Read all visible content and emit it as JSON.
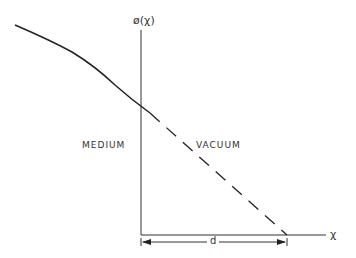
{
  "diagram": {
    "y_axis_label": "ø(χ)",
    "x_axis_label": "χ",
    "region_left_label": "MEDIUM",
    "region_right_label": "VACUUM",
    "distance_label": "d",
    "ink_color": "#222222",
    "curve": {
      "style": "solid",
      "description": "potential in medium, decreasing"
    },
    "extrapolation": {
      "style": "dashed",
      "description": "linear extrapolation in vacuum reaching zero at x = d"
    }
  }
}
